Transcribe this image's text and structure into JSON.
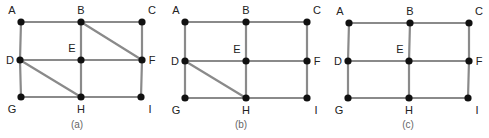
{
  "graphs": [
    {
      "caption": "(a)",
      "caption_pos": [
        77,
        128
      ],
      "nodes": {
        "A": [
          21,
          22
        ],
        "B": [
          81,
          22
        ],
        "C": [
          142,
          22
        ],
        "D": [
          20,
          60
        ],
        "E": [
          81,
          60
        ],
        "F": [
          142,
          60
        ],
        "G": [
          21,
          97
        ],
        "H": [
          81,
          97
        ],
        "I": [
          141,
          97
        ]
      },
      "edges": [
        [
          "A",
          "B"
        ],
        [
          "B",
          "C"
        ],
        [
          "A",
          "D"
        ],
        [
          "D",
          "G"
        ],
        [
          "B",
          "E"
        ],
        [
          "E",
          "H"
        ],
        [
          "C",
          "F"
        ],
        [
          "F",
          "I"
        ],
        [
          "D",
          "E"
        ],
        [
          "E",
          "F"
        ],
        [
          "G",
          "H"
        ],
        [
          "H",
          "I"
        ],
        [
          "B",
          "F"
        ],
        [
          "D",
          "H"
        ]
      ]
    },
    {
      "caption": "(b)",
      "caption_pos": [
        241,
        128
      ],
      "nodes": {
        "A": [
          185,
          22
        ],
        "B": [
          246,
          22
        ],
        "C": [
          307,
          22
        ],
        "D": [
          185,
          61
        ],
        "E": [
          246,
          61
        ],
        "F": [
          307,
          61
        ],
        "G": [
          185,
          98
        ],
        "H": [
          246,
          98
        ],
        "I": [
          307,
          98
        ]
      },
      "edges": [
        [
          "A",
          "B"
        ],
        [
          "B",
          "C"
        ],
        [
          "A",
          "D"
        ],
        [
          "D",
          "G"
        ],
        [
          "B",
          "E"
        ],
        [
          "E",
          "H"
        ],
        [
          "C",
          "F"
        ],
        [
          "F",
          "I"
        ],
        [
          "D",
          "E"
        ],
        [
          "E",
          "F"
        ],
        [
          "G",
          "H"
        ],
        [
          "H",
          "I"
        ],
        [
          "D",
          "H"
        ]
      ]
    },
    {
      "caption": "(c)",
      "caption_pos": [
        408,
        128
      ],
      "nodes": {
        "A": [
          349,
          23
        ],
        "B": [
          410,
          23
        ],
        "C": [
          469,
          23
        ],
        "D": [
          348,
          61
        ],
        "E": [
          409,
          61
        ],
        "F": [
          469,
          61
        ],
        "G": [
          348,
          98
        ],
        "H": [
          409,
          98
        ],
        "I": [
          468,
          98
        ]
      },
      "edges": [
        [
          "A",
          "B"
        ],
        [
          "B",
          "C"
        ],
        [
          "A",
          "D"
        ],
        [
          "D",
          "G"
        ],
        [
          "B",
          "E"
        ],
        [
          "E",
          "H"
        ],
        [
          "C",
          "F"
        ],
        [
          "F",
          "I"
        ],
        [
          "D",
          "E"
        ],
        [
          "E",
          "F"
        ],
        [
          "G",
          "H"
        ],
        [
          "H",
          "I"
        ]
      ]
    }
  ],
  "label_offsets": {
    "A": [
      -9,
      -8
    ],
    "B": [
      0,
      -8
    ],
    "C": [
      10,
      -8
    ],
    "D": [
      -10,
      4
    ],
    "E": [
      -9,
      -8
    ],
    "F": [
      10,
      4
    ],
    "G": [
      -9,
      16
    ],
    "H": [
      0,
      16
    ],
    "I": [
      9,
      16
    ]
  },
  "colors": {
    "edge": "#8a8a8a",
    "node": "#111111",
    "label": "#222222",
    "caption": "#666666"
  }
}
